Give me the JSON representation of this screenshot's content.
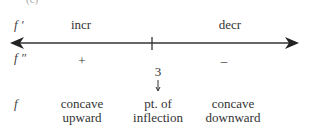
{
  "part_label": "(c)",
  "rows": {
    "f_prime": {
      "label": "f ′",
      "left": "incr",
      "right": "decr"
    },
    "f_double_prime": {
      "label": "f ″",
      "left": "+",
      "right": "–"
    },
    "f": {
      "label": "f",
      "left": [
        "concave",
        "upward"
      ],
      "middle": [
        "pt. of",
        "inflection"
      ],
      "right": [
        "concave",
        "downward"
      ]
    }
  },
  "number_line": {
    "critical_value": "3"
  }
}
